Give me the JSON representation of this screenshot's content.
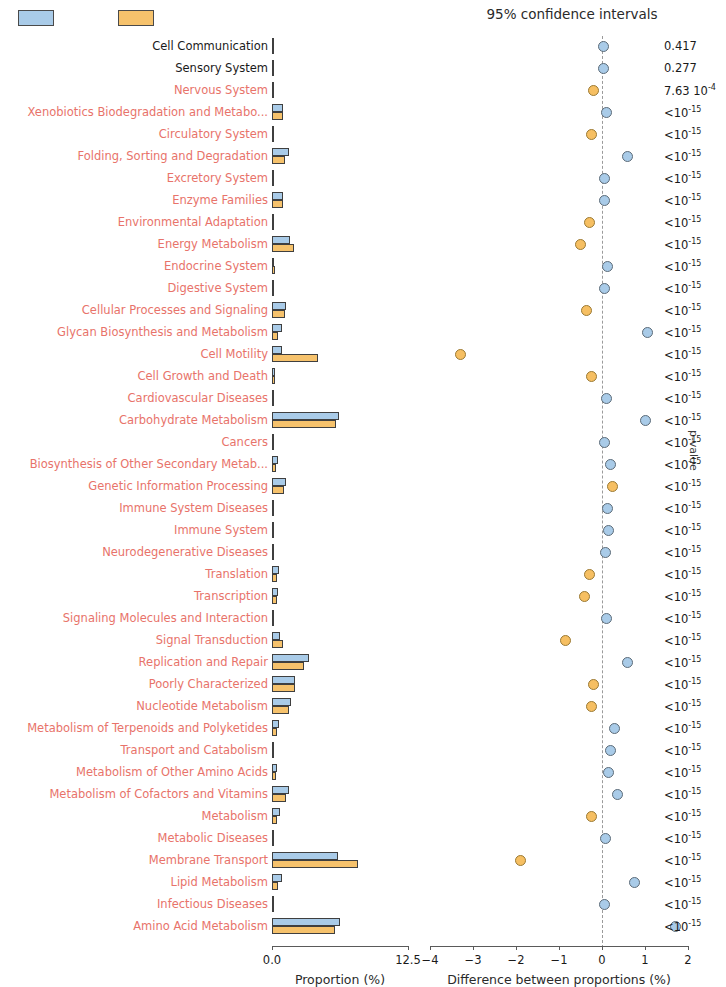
{
  "legend": {
    "series": [
      {
        "name": "group-1",
        "color": "#a9cbe8"
      },
      {
        "name": "group-2",
        "color": "#f6c26c"
      }
    ]
  },
  "titles": {
    "ci_title": "95% confidence intervals",
    "pvalue_axis": "p-value",
    "proportion_axis": "Proportion (%)",
    "difference_axis": "Difference between proportions (%)"
  },
  "axes": {
    "proportion_ticks": [
      "0.0",
      "12.5"
    ],
    "proportion_range": [
      0,
      12.5
    ],
    "difference_ticks": [
      "−4",
      "−3",
      "−2",
      "−1",
      "0",
      "1",
      "2"
    ],
    "difference_range": [
      -4,
      2
    ]
  },
  "chart_data": {
    "type": "bar",
    "title": "95% confidence intervals",
    "xlabel": "Proportion (%)",
    "xlabel2": "Difference between proportions (%)",
    "ylabel": "p-value",
    "xlim": [
      0,
      12.5
    ],
    "xlim2": [
      -4,
      2
    ],
    "grid": false,
    "legend_position": "top-left",
    "categories": [
      "Cell Communication",
      "Sensory System",
      "Nervous System",
      "Xenobiotics Biodegradation and Metabo...",
      "Circulatory System",
      "Folding, Sorting and Degradation",
      "Excretory System",
      "Enzyme Families",
      "Environmental Adaptation",
      "Energy Metabolism",
      "Endocrine System",
      "Digestive System",
      "Cellular Processes and Signaling",
      "Glycan Biosynthesis and Metabolism",
      "Cell Motility",
      "Cell Growth and Death",
      "Cardiovascular Diseases",
      "Carbohydrate Metabolism",
      "Cancers",
      "Biosynthesis of Other Secondary Metab...",
      "Genetic Information Processing",
      "Immune System Diseases",
      "Immune System",
      "Neurodegenerative Diseases",
      "Translation",
      "Transcription",
      "Signaling Molecules and Interaction",
      "Signal Transduction",
      "Replication and Repair",
      "Poorly Characterized",
      "Nucleotide Metabolism",
      "Metabolism of Terpenoids and Polyketides",
      "Transport and Catabolism",
      "Metabolism of Other Amino Acids",
      "Metabolism of Cofactors and Vitamins",
      "Metabolism",
      "Metabolic Diseases",
      "Membrane Transport",
      "Lipid Metabolism",
      "Infectious Diseases",
      "Amino Acid Metabolism"
    ],
    "series": [
      {
        "name": "group-1",
        "color": "#a9cbe8",
        "values": [
          0.04,
          0.05,
          0.06,
          1.05,
          0.05,
          1.55,
          0.04,
          1.05,
          0.1,
          1.7,
          0.22,
          0.05,
          1.25,
          0.95,
          0.9,
          0.3,
          0.05,
          6.15,
          0.05,
          0.55,
          1.25,
          0.05,
          0.05,
          0.06,
          0.65,
          0.55,
          0.1,
          0.75,
          3.4,
          2.15,
          1.75,
          0.65,
          0.16,
          0.45,
          1.55,
          0.7,
          0.06,
          6.1,
          0.95,
          0.18,
          6.25
        ]
      },
      {
        "name": "group-2",
        "color": "#f6c26c",
        "values": [
          0.03,
          0.04,
          0.09,
          1.05,
          0.07,
          1.2,
          0.04,
          1.05,
          0.13,
          2.05,
          0.25,
          0.04,
          1.15,
          0.55,
          4.2,
          0.32,
          0.04,
          5.9,
          0.04,
          0.4,
          1.1,
          0.04,
          0.04,
          0.05,
          0.5,
          0.42,
          0.12,
          1.0,
          2.95,
          2.1,
          1.6,
          0.45,
          0.19,
          0.35,
          1.25,
          0.5,
          0.05,
          7.95,
          0.55,
          0.2,
          5.75
        ]
      }
    ],
    "differences": [
      0.04,
      0.04,
      -0.2,
      0.1,
      -0.25,
      0.6,
      0.06,
      0.05,
      -0.3,
      -0.5,
      0.12,
      0.05,
      -0.35,
      1.05,
      -3.3,
      -0.25,
      0.1,
      1.0,
      0.05,
      0.2,
      0.25,
      0.12,
      0.15,
      0.08,
      -0.3,
      -0.4,
      0.1,
      -0.85,
      0.6,
      -0.2,
      -0.25,
      0.3,
      0.2,
      0.15,
      0.35,
      -0.25,
      0.08,
      -1.9,
      0.75,
      0.05,
      1.7
    ],
    "difference_ci": [
      [
        -0.05,
        0.13
      ],
      [
        -0.04,
        0.12
      ],
      [
        -0.28,
        -0.12
      ],
      [
        0.02,
        0.18
      ],
      [
        -0.33,
        -0.17
      ],
      [
        0.52,
        0.68
      ],
      [
        -0.02,
        0.14
      ],
      [
        -0.03,
        0.13
      ],
      [
        -0.38,
        -0.22
      ],
      [
        -0.58,
        -0.42
      ],
      [
        0.04,
        0.2
      ],
      [
        -0.03,
        0.13
      ],
      [
        -0.43,
        -0.27
      ],
      [
        0.97,
        1.13
      ],
      [
        -3.4,
        -3.2
      ],
      [
        -0.33,
        -0.17
      ],
      [
        0.02,
        0.18
      ],
      [
        0.92,
        1.08
      ],
      [
        -0.03,
        0.13
      ],
      [
        0.12,
        0.28
      ],
      [
        0.17,
        0.33
      ],
      [
        0.04,
        0.2
      ],
      [
        0.07,
        0.23
      ],
      [
        0.0,
        0.16
      ],
      [
        -0.38,
        -0.22
      ],
      [
        -0.48,
        -0.32
      ],
      [
        0.02,
        0.18
      ],
      [
        -0.93,
        -0.77
      ],
      [
        0.52,
        0.68
      ],
      [
        -0.28,
        -0.12
      ],
      [
        -0.33,
        -0.17
      ],
      [
        0.22,
        0.38
      ],
      [
        0.12,
        0.28
      ],
      [
        0.07,
        0.23
      ],
      [
        0.27,
        0.43
      ],
      [
        -0.33,
        -0.17
      ],
      [
        0.0,
        0.16
      ],
      [
        -2.0,
        -1.8
      ],
      [
        0.67,
        0.83
      ],
      [
        -0.03,
        0.13
      ],
      [
        1.62,
        1.78
      ]
    ],
    "dot_colors": [
      "blue",
      "blue",
      "orange",
      "blue",
      "orange",
      "blue",
      "blue",
      "blue",
      "orange",
      "orange",
      "blue",
      "blue",
      "orange",
      "blue",
      "orange",
      "orange",
      "blue",
      "blue",
      "blue",
      "blue",
      "orange",
      "blue",
      "blue",
      "blue",
      "orange",
      "orange",
      "blue",
      "orange",
      "blue",
      "orange",
      "orange",
      "blue",
      "blue",
      "blue",
      "blue",
      "orange",
      "blue",
      "orange",
      "blue",
      "blue",
      "blue"
    ],
    "label_colors": [
      "black",
      "black",
      "red",
      "red",
      "red",
      "red",
      "red",
      "red",
      "red",
      "red",
      "red",
      "red",
      "red",
      "red",
      "red",
      "red",
      "red",
      "red",
      "red",
      "red",
      "red",
      "red",
      "red",
      "red",
      "red",
      "red",
      "red",
      "red",
      "red",
      "red",
      "red",
      "red",
      "red",
      "red",
      "red",
      "red",
      "red",
      "red",
      "red",
      "red",
      "red"
    ],
    "pvalues": [
      "0.417",
      "0.277",
      "7.63 10",
      "<10",
      "<10",
      "<10",
      "<10",
      "<10",
      "<10",
      "<10",
      "<10",
      "<10",
      "<10",
      "<10",
      "<10",
      "<10",
      "<10",
      "<10",
      "<10",
      "<10",
      "<10",
      "<10",
      "<10",
      "<10",
      "<10",
      "<10",
      "<10",
      "<10",
      "<10",
      "<10",
      "<10",
      "<10",
      "<10",
      "<10",
      "<10",
      "<10",
      "<10",
      "<10",
      "<10",
      "<10",
      "<10"
    ],
    "pvalue_exponents": [
      "",
      "",
      "-4",
      "-15",
      "-15",
      "-15",
      "-15",
      "-15",
      "-15",
      "-15",
      "-15",
      "-15",
      "-15",
      "-15",
      "-15",
      "-15",
      "-15",
      "-15",
      "-15",
      "-15",
      "-15",
      "-15",
      "-15",
      "-15",
      "-15",
      "-15",
      "-15",
      "-15",
      "-15",
      "-15",
      "-15",
      "-15",
      "-15",
      "-15",
      "-15",
      "-15",
      "-15",
      "-15",
      "-15",
      "-15",
      "-15"
    ]
  }
}
